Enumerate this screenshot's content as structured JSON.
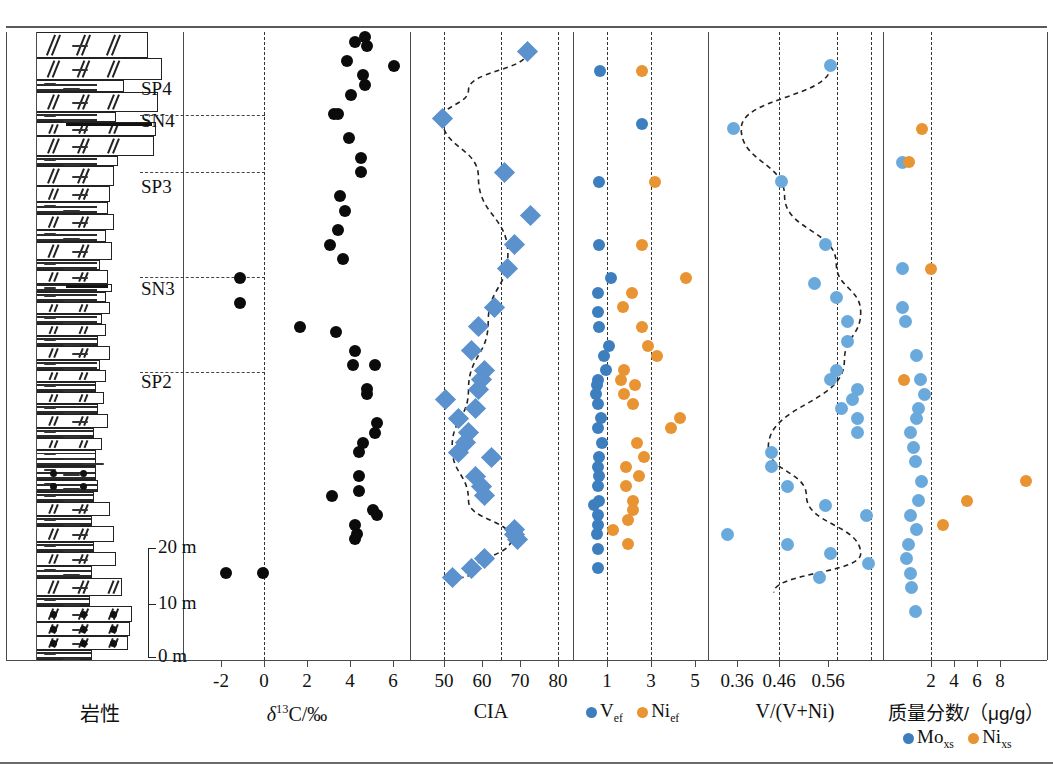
{
  "figure": {
    "colors": {
      "blue": "#3d7ebf",
      "light_blue": "#6aa9dc",
      "orange": "#e89433",
      "diamond_blue": "#5b92cd",
      "black": "#0b0b0b",
      "axis": "#4a4a4a"
    }
  },
  "panels": [
    {
      "id": "lithology",
      "axis_label": "岩性",
      "x0": 6,
      "x1": 183
    },
    {
      "id": "d13c",
      "axis_label": "δ13C/‰",
      "x0": 183,
      "x1": 410
    },
    {
      "id": "cia",
      "axis_label": "CIA",
      "x0": 410,
      "x1": 573
    },
    {
      "id": "vni_ef",
      "axis_label": "",
      "x0": 573,
      "x1": 708
    },
    {
      "id": "v_ratio",
      "axis_label": "V/(V+Ni)",
      "x0": 708,
      "x1": 883
    },
    {
      "id": "mass_fraction",
      "axis_label": "质量分数/（μg/g）",
      "x0": 883,
      "x1": 1047
    }
  ],
  "zones": [
    {
      "label": "SP4",
      "y": 90
    },
    {
      "label": "SN4",
      "y": 122
    },
    {
      "label": "SP3",
      "y": 188
    },
    {
      "label": "SN3",
      "y": 290
    },
    {
      "label": "SP2",
      "y": 383
    }
  ],
  "zone_boundaries_y": [
    115,
    172,
    277,
    372
  ],
  "depth_scale": {
    "ticks": [
      {
        "label": "20 m",
        "y": 548
      },
      {
        "label": "10 m",
        "y": 604
      },
      {
        "label": "0 m",
        "y": 657
      }
    ]
  },
  "axes": {
    "d13c": {
      "label": "δ13C/‰",
      "ticks": [
        -2,
        0,
        2,
        4,
        6
      ],
      "tick_x": [
        221,
        264,
        307,
        350,
        393
      ],
      "zero_line_x": 264,
      "range": [
        -3.5,
        7.5
      ]
    },
    "cia": {
      "label": "CIA",
      "ticks": [
        50,
        60,
        70,
        80
      ],
      "tick_x": [
        444,
        482,
        520,
        558
      ],
      "grid_x": [
        444,
        501,
        558
      ],
      "range": [
        40,
        86
      ]
    },
    "vni_ef": {
      "ticks": [
        1,
        3,
        5
      ],
      "tick_x": [
        607,
        651,
        695
      ],
      "grid_x": [
        607,
        651
      ],
      "legend": [
        {
          "label": "Vef",
          "color": "#3d7ebf"
        },
        {
          "label": "Nief",
          "color": "#e89433"
        }
      ],
      "range": [
        0.1,
        5.6
      ]
    },
    "v_ratio": {
      "label": "V/(V+Ni)",
      "ticks": [
        "0.36",
        "0.46",
        "0.56"
      ],
      "tick_x": [
        737,
        779,
        828
      ],
      "grid_x": [
        779,
        837,
        871
      ],
      "range": [
        0.32,
        0.62
      ]
    },
    "mass_fraction": {
      "label": "质量分数/（μg/g）",
      "ticks": [
        2,
        4,
        6,
        8
      ],
      "tick_x": [
        931,
        954,
        977,
        1000
      ],
      "grid_x": [
        931
      ],
      "legend": [
        {
          "label": "Moxs",
          "color": "#3d7ebf"
        },
        {
          "label": "Nixs",
          "color": "#e89433"
        }
      ],
      "range": [
        0.2,
        9.5
      ]
    }
  },
  "chart_data": {
    "type": "scatter",
    "orientation": "vertical-depth",
    "ylabel": "Stratigraphic height (m)",
    "ylim": [
      0,
      130
    ],
    "series": [
      {
        "name": "δ13C/‰",
        "panel": "d13c",
        "marker": "circle-black",
        "xlabel": "δ13C/‰",
        "xlim": [
          -3.5,
          7.5
        ],
        "points": [
          [
            5.0,
            128
          ],
          [
            5.5,
            129
          ],
          [
            5.6,
            127
          ],
          [
            4.6,
            124
          ],
          [
            7.0,
            123
          ],
          [
            5.4,
            121
          ],
          [
            5.5,
            119
          ],
          [
            4.8,
            117
          ],
          [
            3.9,
            113
          ],
          [
            4.1,
            113
          ],
          [
            4.7,
            108
          ],
          [
            5.3,
            104
          ],
          [
            5.3,
            101
          ],
          [
            4.2,
            96
          ],
          [
            4.5,
            93
          ],
          [
            4.1,
            89
          ],
          [
            3.7,
            86
          ],
          [
            4.4,
            83
          ],
          [
            -0.9,
            79
          ],
          [
            -0.9,
            74
          ],
          [
            2.2,
            69
          ],
          [
            4.0,
            68
          ],
          [
            5.0,
            64
          ],
          [
            4.9,
            61
          ],
          [
            6.0,
            61
          ],
          [
            5.6,
            56
          ],
          [
            5.6,
            55
          ],
          [
            6.1,
            49
          ],
          [
            6.0,
            47
          ],
          [
            5.4,
            45
          ],
          [
            5.2,
            43
          ],
          [
            5.2,
            38
          ],
          [
            5.2,
            35
          ],
          [
            3.8,
            34
          ],
          [
            5.9,
            31
          ],
          [
            6.1,
            30
          ],
          [
            5.0,
            28
          ],
          [
            5.1,
            26
          ],
          [
            5.0,
            25
          ],
          [
            -1.6,
            18
          ],
          [
            0.3,
            18
          ]
        ]
      },
      {
        "name": "CIA",
        "panel": "cia",
        "marker": "diamond-blue",
        "xlabel": "CIA",
        "xlim": [
          40,
          86
        ],
        "points": [
          [
            74,
            126
          ],
          [
            48,
            112
          ],
          [
            67,
            101
          ],
          [
            75,
            92
          ],
          [
            70,
            86
          ],
          [
            68,
            81
          ],
          [
            64,
            73
          ],
          [
            59,
            69
          ],
          [
            57,
            64
          ],
          [
            61,
            60
          ],
          [
            60,
            58
          ],
          [
            59,
            56
          ],
          [
            49,
            54
          ],
          [
            58,
            52
          ],
          [
            53,
            50
          ],
          [
            56,
            47
          ],
          [
            55,
            45
          ],
          [
            53,
            43
          ],
          [
            63,
            42
          ],
          [
            58,
            38
          ],
          [
            60,
            36
          ],
          [
            61,
            34
          ],
          [
            70,
            27
          ],
          [
            70,
            26
          ],
          [
            71,
            25
          ],
          [
            61,
            21
          ],
          [
            57,
            19
          ],
          [
            51,
            17
          ]
        ],
        "trend": [
          [
            74,
            126
          ],
          [
            56,
            118
          ],
          [
            48,
            112
          ],
          [
            59,
            100
          ],
          [
            68,
            84
          ],
          [
            62,
            70
          ],
          [
            56,
            56
          ],
          [
            51,
            44
          ],
          [
            56,
            33
          ],
          [
            69,
            25
          ],
          [
            57,
            18
          ],
          [
            50,
            16
          ]
        ]
      },
      {
        "name": "Vef",
        "panel": "vni_ef",
        "marker": "circle-blue",
        "xlabel": "Vef",
        "xlim": [
          0.1,
          5.6
        ],
        "points": [
          [
            1.05,
            122
          ],
          [
            2.9,
            111
          ],
          [
            1.0,
            99
          ],
          [
            1.0,
            86
          ],
          [
            1.55,
            79
          ],
          [
            0.95,
            76
          ],
          [
            0.95,
            72
          ],
          [
            1.0,
            69
          ],
          [
            1.45,
            65
          ],
          [
            1.2,
            63
          ],
          [
            1.3,
            60
          ],
          [
            0.95,
            58
          ],
          [
            0.9,
            57
          ],
          [
            0.85,
            55
          ],
          [
            0.95,
            53
          ],
          [
            1.1,
            50
          ],
          [
            0.95,
            48
          ],
          [
            1.15,
            45
          ],
          [
            1.0,
            42
          ],
          [
            0.95,
            40
          ],
          [
            1.0,
            38
          ],
          [
            0.95,
            36
          ],
          [
            1.0,
            33
          ],
          [
            0.75,
            32
          ],
          [
            0.95,
            30
          ],
          [
            0.95,
            28
          ],
          [
            0.9,
            26
          ],
          [
            0.95,
            23
          ],
          [
            0.95,
            19
          ]
        ]
      },
      {
        "name": "Nief",
        "panel": "vni_ef",
        "marker": "circle-orange",
        "xlabel": "Nief",
        "xlim": [
          0.1,
          5.6
        ],
        "points": [
          [
            2.9,
            122
          ],
          [
            3.5,
            99
          ],
          [
            2.9,
            86
          ],
          [
            4.9,
            79
          ],
          [
            2.45,
            76
          ],
          [
            2.05,
            73
          ],
          [
            2.9,
            69
          ],
          [
            3.2,
            65
          ],
          [
            3.6,
            63
          ],
          [
            2.1,
            60
          ],
          [
            2.0,
            58
          ],
          [
            2.6,
            57
          ],
          [
            2.1,
            55
          ],
          [
            2.5,
            53
          ],
          [
            4.6,
            50
          ],
          [
            4.2,
            48
          ],
          [
            2.7,
            45
          ],
          [
            3.0,
            42
          ],
          [
            2.2,
            40
          ],
          [
            2.8,
            38
          ],
          [
            2.2,
            36
          ],
          [
            2.5,
            33
          ],
          [
            2.5,
            31
          ],
          [
            2.3,
            29
          ],
          [
            1.6,
            27
          ],
          [
            2.3,
            24
          ]
        ]
      },
      {
        "name": "V/(V+Ni)",
        "panel": "v_ratio",
        "marker": "circle-lightblue",
        "xlabel": "V/(V+Ni)",
        "xlim": [
          0.32,
          0.62
        ],
        "points": [
          [
            0.535,
            123
          ],
          [
            0.355,
            110
          ],
          [
            0.445,
            99
          ],
          [
            0.525,
            86
          ],
          [
            0.505,
            78
          ],
          [
            0.545,
            75
          ],
          [
            0.565,
            70
          ],
          [
            0.565,
            66
          ],
          [
            0.545,
            60
          ],
          [
            0.535,
            58
          ],
          [
            0.585,
            56
          ],
          [
            0.575,
            54
          ],
          [
            0.555,
            52
          ],
          [
            0.585,
            50
          ],
          [
            0.585,
            47
          ],
          [
            0.425,
            43
          ],
          [
            0.425,
            40
          ],
          [
            0.455,
            36
          ],
          [
            0.525,
            32
          ],
          [
            0.6,
            30
          ],
          [
            0.345,
            26
          ],
          [
            0.455,
            24
          ],
          [
            0.535,
            22
          ],
          [
            0.605,
            20
          ],
          [
            0.515,
            17
          ]
        ],
        "trend": [
          [
            0.535,
            123
          ],
          [
            0.37,
            110
          ],
          [
            0.45,
            96
          ],
          [
            0.545,
            82
          ],
          [
            0.59,
            72
          ],
          [
            0.56,
            62
          ],
          [
            0.42,
            44
          ],
          [
            0.49,
            34
          ],
          [
            0.59,
            22
          ],
          [
            0.43,
            14
          ]
        ]
      },
      {
        "name": "Moxs",
        "panel": "mass_fraction",
        "marker": "circle-lightblue",
        "xlabel": "Moxs",
        "xlim": [
          0.2,
          9.5
        ],
        "points": [
          [
            1.0,
            103
          ],
          [
            1.0,
            81
          ],
          [
            1.0,
            73
          ],
          [
            1.2,
            70
          ],
          [
            1.9,
            63
          ],
          [
            2.1,
            58
          ],
          [
            2.4,
            55
          ],
          [
            2.0,
            52
          ],
          [
            1.9,
            50
          ],
          [
            1.5,
            47
          ],
          [
            1.7,
            44
          ],
          [
            1.8,
            41
          ],
          [
            2.2,
            37
          ],
          [
            2.0,
            33
          ],
          [
            1.5,
            30
          ],
          [
            1.9,
            27
          ],
          [
            1.4,
            24
          ],
          [
            1.3,
            21
          ],
          [
            1.5,
            18
          ],
          [
            1.6,
            15
          ],
          [
            1.8,
            10
          ]
        ]
      },
      {
        "name": "Nixs",
        "panel": "mass_fraction",
        "marker": "circle-orange",
        "xlabel": "Nixs",
        "xlim": [
          0.2,
          9.5
        ],
        "points": [
          [
            2.2,
            110
          ],
          [
            1.4,
            103
          ],
          [
            2.8,
            81
          ],
          [
            1.1,
            58
          ],
          [
            8.6,
            37
          ],
          [
            5.0,
            33
          ],
          [
            3.5,
            28
          ]
        ]
      }
    ]
  },
  "legends": {
    "vni_ef": [
      {
        "label": "V",
        "sub": "ef",
        "color": "#3d7ebf"
      },
      {
        "label": "Ni",
        "sub": "ef",
        "color": "#e89433"
      }
    ],
    "mass_fraction": [
      {
        "label": "Mo",
        "sub": "xs",
        "color": "#3d7ebf"
      },
      {
        "label": "Ni",
        "sub": "xs",
        "color": "#e89433"
      }
    ]
  }
}
